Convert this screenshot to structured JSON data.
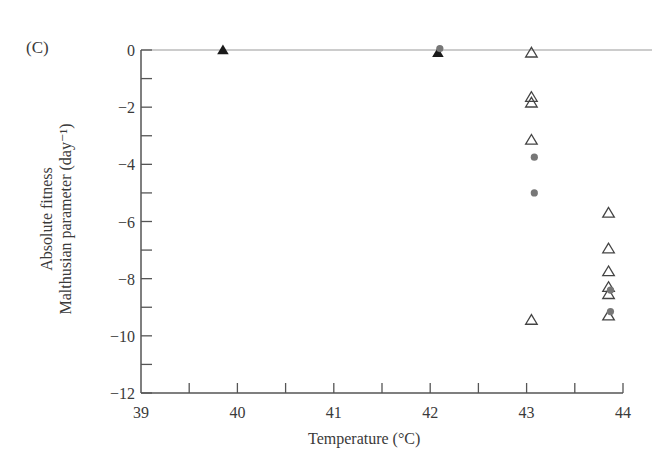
{
  "panel_label": "(C)",
  "axes": {
    "ylabel_line1": "Absolute fitness",
    "ylabel_line2": "Malthusian parameter (day⁻¹)",
    "xlabel": "Temperature (°C)"
  },
  "colors": {
    "axis": "#555555",
    "zero_line": "#bbbbbb",
    "filled_triangle": "#1a1a1a",
    "open_triangle": "#444444",
    "dot": "#777777"
  },
  "chart_data": {
    "type": "scatter",
    "title": "",
    "panel": "(C)",
    "xlabel": "Temperature (°C)",
    "ylabel": "Absolute fitness / Malthusian parameter (day⁻¹)",
    "xlim": [
      39,
      44
    ],
    "ylim": [
      -12,
      0
    ],
    "xticks": [
      39,
      40,
      41,
      42,
      43,
      44
    ],
    "xtick_labels": [
      "39",
      "40",
      "41",
      "42",
      "43",
      "44"
    ],
    "xminor_ticks": [
      39.5,
      40.5,
      41.5,
      42.5,
      43.5
    ],
    "yticks": [
      0,
      -2,
      -4,
      -6,
      -8,
      -10,
      -12
    ],
    "ytick_labels": [
      "0",
      "−2",
      "−4",
      "−6",
      "−8",
      "−10",
      "−12"
    ],
    "yminor_ticks": [
      -1,
      -3,
      -5,
      -7,
      -9,
      -11
    ],
    "reference_line": {
      "y": 0,
      "style": "horizontal gray line"
    },
    "grid": false,
    "legend": null,
    "series": [
      {
        "name": "filled triangles",
        "marker": "triangle-filled",
        "points": [
          {
            "x": 39.85,
            "y": 0.0
          },
          {
            "x": 42.08,
            "y": -0.1
          }
        ]
      },
      {
        "name": "open triangles",
        "marker": "triangle-open",
        "points": [
          {
            "x": 43.05,
            "y": -0.1
          },
          {
            "x": 43.05,
            "y": -1.65
          },
          {
            "x": 43.05,
            "y": -1.85
          },
          {
            "x": 43.05,
            "y": -3.15
          },
          {
            "x": 43.05,
            "y": -9.45
          },
          {
            "x": 43.85,
            "y": -5.7
          },
          {
            "x": 43.85,
            "y": -6.95
          },
          {
            "x": 43.85,
            "y": -7.75
          },
          {
            "x": 43.85,
            "y": -8.3
          },
          {
            "x": 43.85,
            "y": -8.55
          },
          {
            "x": 43.85,
            "y": -9.3
          }
        ]
      },
      {
        "name": "gray dots",
        "marker": "circle-filled",
        "points": [
          {
            "x": 42.1,
            "y": 0.05
          },
          {
            "x": 43.08,
            "y": -3.75
          },
          {
            "x": 43.08,
            "y": -5.0
          },
          {
            "x": 43.87,
            "y": -8.4
          },
          {
            "x": 43.87,
            "y": -9.15
          }
        ]
      }
    ]
  }
}
